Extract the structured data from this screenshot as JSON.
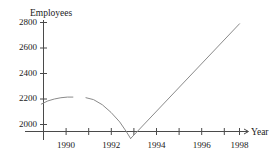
{
  "chart_data": {
    "type": "line",
    "title": "",
    "xlabel": "Year",
    "ylabel": "Employees",
    "xlim": [
      1988.6,
      1998.8
    ],
    "ylim": [
      1820,
      2860
    ],
    "grid": false,
    "legend": "none",
    "y_ticks": [
      2000,
      2200,
      2400,
      2600,
      2800
    ],
    "y_tick_labels": [
      "2000",
      "2200",
      "2400",
      "2600",
      "2800"
    ],
    "x_ticks": [
      1989,
      1990,
      1991,
      1992,
      1993,
      1994,
      1995,
      1996,
      1997,
      1998
    ],
    "x_tick_labels": [
      "1990",
      "1992",
      "1994",
      "1996",
      "1998"
    ],
    "x_labeled_ticks": [
      1990,
      1992,
      1994,
      1996,
      1998
    ],
    "series": [
      {
        "name": "segment-1",
        "x": [
          1988.9,
          1989.2,
          1989.5,
          1989.8,
          1990.1,
          1990.35
        ],
        "y": [
          2160,
          2185,
          2200,
          2210,
          2215,
          2215
        ]
      },
      {
        "name": "segment-2",
        "x": [
          1990.95,
          1991.3,
          1991.7,
          1992.1,
          1992.5,
          1992.8,
          1993.0
        ],
        "y": [
          2210,
          2195,
          2155,
          2095,
          2020,
          1945,
          1890
        ]
      },
      {
        "name": "segment-3",
        "x": [
          1993.0,
          1998.0
        ],
        "y": [
          1890,
          2790
        ]
      }
    ],
    "min_point": {
      "x": 1993,
      "y": 1890
    },
    "max_point": {
      "x": 1998,
      "y": 2790
    }
  },
  "axis_titles": {
    "y": "Employees",
    "x": "Year"
  },
  "colors": {
    "axis": "#4a4a4a",
    "curve": "#8a8a8a",
    "text": "#1a1a1a",
    "background": "#ffffff"
  }
}
